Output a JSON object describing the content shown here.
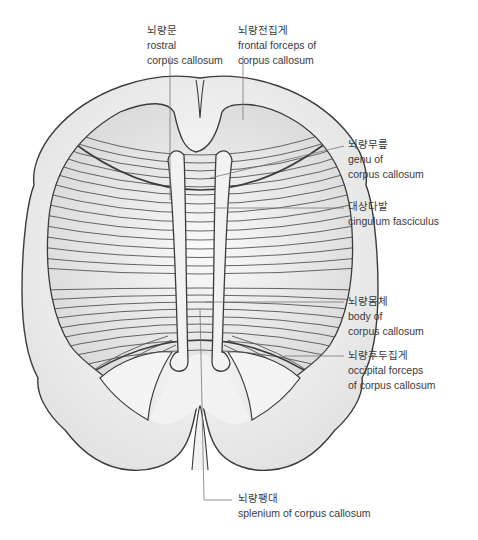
{
  "figure": {
    "colors": {
      "outline": "#3c3c3c",
      "fill_light": "#f4f4f4",
      "fill_mid": "#e6e6e6",
      "fiber": "#555555",
      "leader": "#777777",
      "text": "#3a3a3a"
    }
  },
  "labels": [
    {
      "id": "rostral",
      "ko": "뇌량문",
      "en1": "rostral",
      "en2": "corpus callosum"
    },
    {
      "id": "frontal_forceps",
      "ko": "뇌량전집게",
      "en1": "frontal forceps of",
      "en2": "corpus callosum"
    },
    {
      "id": "genu",
      "ko": "뇌량무릎",
      "en1": "genu of",
      "en2": "corpus callosum"
    },
    {
      "id": "cingulum",
      "ko": "대상다발",
      "en1": "cingulum fasciculus",
      "en2": ""
    },
    {
      "id": "body",
      "ko": "뇌량몸체",
      "en1": "body of",
      "en2": "corpus callosum"
    },
    {
      "id": "occipital_forceps",
      "ko": "뇌량후두집게",
      "en1": "occipital forceps",
      "en2": "of corpus callosum"
    },
    {
      "id": "splenium",
      "ko": "뇌량팽대",
      "en1": "splenium of corpus callosum",
      "en2": ""
    }
  ]
}
